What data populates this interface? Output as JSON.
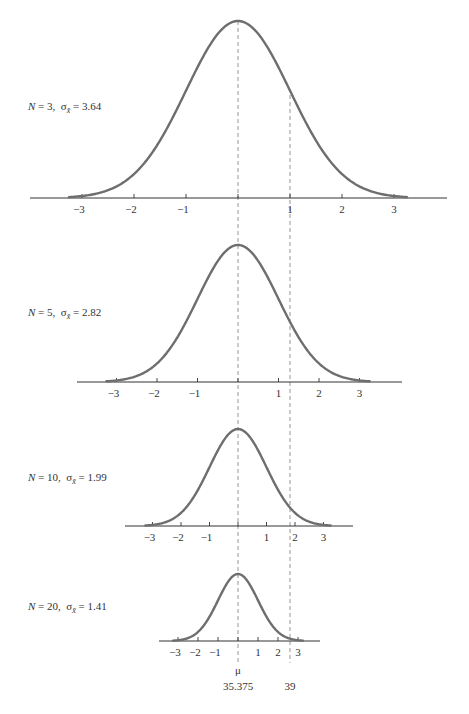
{
  "chart_data": {
    "type": "line",
    "title": "",
    "mu": 35.375,
    "mu_symbol": "μ",
    "mu_label": "35.375",
    "reference_value": 39,
    "reference_label": "39",
    "center_x": 238,
    "colors": {
      "curve": "#6e6e6e",
      "axis": "#333333",
      "dashed": "#8a8a8a",
      "text": "#333333"
    },
    "xlabel": "",
    "ylabel": "",
    "grid": false,
    "panels": [
      {
        "label_n": "N = 3,",
        "label_sigma": "σ",
        "label_sigma_sub": "x̄",
        "label_value": "= 3.64",
        "N": 3,
        "sigma": 3.64,
        "tick_labels": [
          "−3",
          "−2",
          "−1",
          "",
          "1",
          "2",
          "3"
        ],
        "ticks": [
          -3,
          -2,
          -1,
          0,
          1,
          2,
          3
        ],
        "geom": {
          "spacing": 52,
          "axis_y": 198,
          "height": 177,
          "axis_left": 30,
          "axis_right": 447,
          "label_x": 28,
          "label_y": 100
        }
      },
      {
        "label_n": "N = 5,",
        "label_sigma": "σ",
        "label_sigma_sub": "x̄",
        "label_value": "= 2.82",
        "N": 5,
        "sigma": 2.82,
        "tick_labels": [
          "−3",
          "−2",
          "−1",
          "",
          "1",
          "2",
          "3"
        ],
        "ticks": [
          -3,
          -2,
          -1,
          0,
          1,
          2,
          3
        ],
        "geom": {
          "spacing": 40.5,
          "axis_y": 382,
          "height": 137,
          "axis_left": 77,
          "axis_right": 402,
          "label_x": 28,
          "label_y": 306
        }
      },
      {
        "label_n": "N = 10,",
        "label_sigma": "σ",
        "label_sigma_sub": "x̄",
        "label_value": "= 1.99",
        "N": 10,
        "sigma": 1.99,
        "tick_labels": [
          "−3",
          "−2",
          "−1",
          "",
          "1",
          "2",
          "3"
        ],
        "ticks": [
          -3,
          -2,
          -1,
          0,
          1,
          2,
          3
        ],
        "geom": {
          "spacing": 28.5,
          "axis_y": 526,
          "height": 97,
          "axis_left": 125,
          "axis_right": 353,
          "label_x": 28,
          "label_y": 471
        }
      },
      {
        "label_n": "N = 20,",
        "label_sigma": "σ",
        "label_sigma_sub": "x̄",
        "label_value": "= 1.41",
        "N": 20,
        "sigma": 1.41,
        "tick_labels": [
          "−3",
          "−2",
          "−1",
          "",
          "1",
          "2",
          "3"
        ],
        "ticks": [
          -3,
          -2,
          -1,
          0,
          1,
          2,
          3
        ],
        "geom": {
          "spacing": 20,
          "axis_y": 641,
          "height": 67,
          "axis_left": 159,
          "axis_right": 320,
          "label_x": 28,
          "label_y": 600
        }
      }
    ],
    "dashed_lines": [
      {
        "name": "mean-line",
        "x": 238,
        "y_top": 21,
        "y_bottom": 663
      },
      {
        "name": "reference-line",
        "x": 290,
        "y_top": 95,
        "y_bottom": 663
      }
    ],
    "bottom_labels": {
      "mu_y": 674,
      "mu_value_y": 690,
      "ref_x": 290
    }
  }
}
